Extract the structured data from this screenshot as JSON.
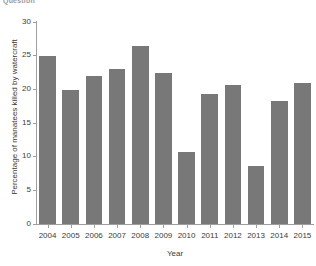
{
  "caption_fragment": "Question",
  "chart_data": {
    "type": "bar",
    "title": "",
    "xlabel": "Year",
    "ylabel": "Percentage of manatees killed by watercraft",
    "categories": [
      "2004",
      "2005",
      "2006",
      "2007",
      "2008",
      "2009",
      "2010",
      "2011",
      "2012",
      "2013",
      "2014",
      "2015"
    ],
    "values": [
      25.0,
      19.9,
      22.0,
      23.0,
      26.5,
      22.5,
      10.7,
      19.3,
      20.7,
      8.6,
      18.3,
      21.0
    ],
    "ylim": [
      0,
      30
    ],
    "yticks": [
      0,
      5,
      10,
      15,
      20,
      25,
      30
    ],
    "ytick_labels": [
      "0",
      "5",
      "10",
      "15",
      "20",
      "25",
      "30"
    ],
    "grid": false,
    "legend": false,
    "bar_color": "#787878",
    "axis_color": "#9e9e9e",
    "background": "#ffffff"
  }
}
